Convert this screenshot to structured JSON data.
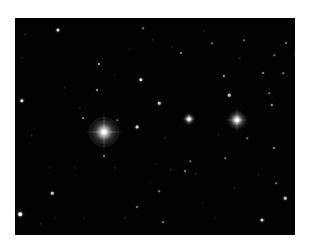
{
  "image": {
    "subject": "star field",
    "background_color": "#020202",
    "frame": {
      "left": 15,
      "top": 18,
      "width": 280,
      "height": 217
    }
  },
  "bright_stars": [
    {
      "name": "primary-bright-star",
      "x": 89,
      "y": 114,
      "glow": 30,
      "core": 5,
      "spike": 40,
      "ring": 28
    },
    {
      "name": "secondary-bright-star",
      "x": 222,
      "y": 102,
      "glow": 20,
      "core": 4,
      "spike": 24,
      "ring": 0
    },
    {
      "name": "tertiary-bright-star",
      "x": 174,
      "y": 101,
      "glow": 12,
      "core": 3,
      "spike": 14,
      "ring": 0
    }
  ],
  "faint_stars": [
    [
      43,
      12,
      2.2,
      0.9
    ],
    [
      128,
      10,
      1.2,
      0.5
    ],
    [
      7,
      83,
      2.4,
      0.95
    ],
    [
      126,
      62,
      2.4,
      0.9
    ],
    [
      84,
      46,
      1.6,
      0.7
    ],
    [
      82,
      72,
      1.3,
      0.6
    ],
    [
      144,
      85,
      1.8,
      0.8
    ],
    [
      122,
      109,
      2,
      0.85
    ],
    [
      68,
      100,
      1.3,
      0.55
    ],
    [
      89,
      138,
      1.4,
      0.6
    ],
    [
      37,
      175,
      1.8,
      0.8
    ],
    [
      5,
      196,
      2.6,
      1.0
    ],
    [
      17,
      118,
      1,
      0.45
    ],
    [
      100,
      150,
      1,
      0.4
    ],
    [
      60,
      150,
      1,
      0.35
    ],
    [
      144,
      173,
      1.2,
      0.5
    ],
    [
      122,
      189,
      1.4,
      0.55
    ],
    [
      166,
      35,
      1.4,
      0.6
    ],
    [
      197,
      25,
      1.2,
      0.5
    ],
    [
      209,
      58,
      1.6,
      0.7
    ],
    [
      214,
      77,
      1.8,
      0.8
    ],
    [
      157,
      29,
      1,
      0.4
    ],
    [
      225,
      40,
      1,
      0.45
    ],
    [
      248,
      55,
      1.3,
      0.55
    ],
    [
      257,
      87,
      1.6,
      0.7
    ],
    [
      254,
      75,
      1.2,
      0.5
    ],
    [
      268,
      55,
      1.1,
      0.5
    ],
    [
      271,
      25,
      1.4,
      0.55
    ],
    [
      259,
      37,
      1.1,
      0.45
    ],
    [
      229,
      22,
      1.2,
      0.45
    ],
    [
      189,
      13,
      1,
      0.4
    ],
    [
      138,
      22,
      1,
      0.35
    ],
    [
      7,
      40,
      1,
      0.35
    ],
    [
      10,
      17,
      1,
      0.35
    ],
    [
      210,
      140,
      1.2,
      0.5
    ],
    [
      232,
      120,
      1.1,
      0.45
    ],
    [
      259,
      130,
      1.4,
      0.6
    ],
    [
      170,
      153,
      1.3,
      0.55
    ],
    [
      175,
      143,
      1.1,
      0.45
    ],
    [
      156,
      152,
      1,
      0.4
    ],
    [
      181,
      156,
      1,
      0.4
    ],
    [
      141,
      146,
      1,
      0.35
    ],
    [
      204,
      117,
      1,
      0.4
    ],
    [
      270,
      180,
      1.8,
      0.8
    ],
    [
      247,
      202,
      2.2,
      0.85
    ],
    [
      200,
      200,
      1,
      0.35
    ],
    [
      110,
      200,
      1,
      0.35
    ],
    [
      40,
      200,
      1,
      0.35
    ],
    [
      148,
      204,
      1.3,
      0.5
    ],
    [
      102,
      102,
      1.1,
      0.45
    ],
    [
      65,
      90,
      1,
      0.4
    ],
    [
      50,
      70,
      1,
      0.3
    ],
    [
      35,
      150,
      1,
      0.3
    ],
    [
      261,
      165,
      1.2,
      0.5
    ],
    [
      244,
      157,
      1,
      0.4
    ],
    [
      220,
      170,
      1,
      0.35
    ],
    [
      280,
      37,
      1,
      0.35
    ],
    [
      115,
      32,
      1,
      0.35
    ],
    [
      100,
      57,
      1,
      0.3
    ],
    [
      150,
      120,
      1,
      0.35
    ],
    [
      70,
      200,
      1,
      0.3
    ],
    [
      26,
      206,
      1,
      0.35
    ],
    [
      135,
      165,
      1,
      0.3
    ],
    [
      188,
      185,
      1,
      0.3
    ]
  ]
}
